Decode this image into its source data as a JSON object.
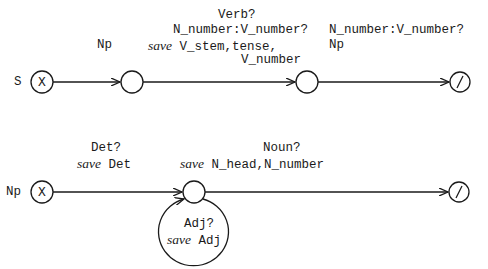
{
  "networks": [
    {
      "name": "S",
      "start_symbol": "X",
      "final_symbol": "/",
      "arcs": [
        {
          "label_lines": [
            "Np"
          ]
        },
        {
          "test": "Verb?",
          "condition": "N_number:V_number?",
          "save_keyword": "save",
          "save_value": "V_stem,tense,",
          "save_cont": "V_number"
        },
        {
          "label_lines": [
            "N_number:V_number?",
            "Np"
          ]
        }
      ]
    },
    {
      "name": "Np",
      "start_symbol": "X",
      "final_symbol": "/",
      "arcs": [
        {
          "test": "Det?",
          "save_keyword": "save",
          "save_value": "Det"
        },
        {
          "test": "Noun?",
          "save_keyword": "save",
          "save_value": "N_head,N_number"
        }
      ],
      "loop": {
        "test": "Adj?",
        "save_keyword": "save",
        "save_value": "Adj"
      }
    }
  ],
  "colors": {
    "ink": "#1a1a1a",
    "background": "#ffffff"
  }
}
